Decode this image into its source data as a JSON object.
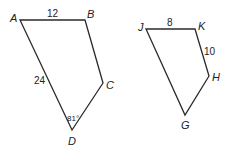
{
  "figures": [
    {
      "name": "ABCD",
      "vertices": [
        {
          "label": "A",
          "x": 20,
          "y": 20,
          "lx": 10,
          "ly": 22
        },
        {
          "label": "B",
          "x": 85,
          "y": 20,
          "lx": 87,
          "ly": 18
        },
        {
          "label": "C",
          "x": 103,
          "y": 83,
          "lx": 106,
          "ly": 89
        },
        {
          "label": "D",
          "x": 72,
          "y": 130,
          "lx": 68,
          "ly": 145
        }
      ],
      "side_labels": [
        {
          "text": "12",
          "side": "AB",
          "x": 47,
          "y": 17
        },
        {
          "text": "24",
          "side": "AD",
          "x": 34,
          "y": 84
        }
      ],
      "angle_labels": [
        {
          "text": "81°",
          "vertex": "D",
          "x": 68,
          "y": 121
        }
      ]
    },
    {
      "name": "JKHG",
      "vertices": [
        {
          "label": "J",
          "x": 146,
          "y": 29,
          "lx": 138,
          "ly": 31
        },
        {
          "label": "K",
          "x": 195,
          "y": 29,
          "lx": 198,
          "ly": 30
        },
        {
          "label": "H",
          "x": 209,
          "y": 76,
          "lx": 212,
          "ly": 81
        },
        {
          "label": "G",
          "x": 185,
          "y": 115,
          "lx": 181,
          "ly": 129
        }
      ],
      "side_labels": [
        {
          "text": "8",
          "side": "JK",
          "x": 168,
          "y": 26
        },
        {
          "text": "10",
          "side": "KH",
          "x": 205,
          "y": 55
        }
      ],
      "angle_labels": []
    }
  ]
}
